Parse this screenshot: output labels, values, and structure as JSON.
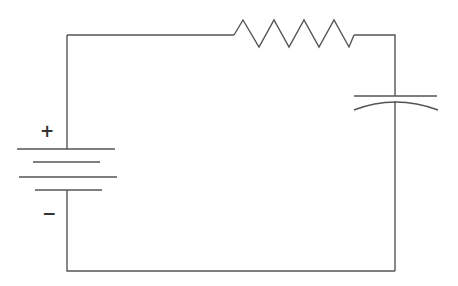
{
  "diagram": {
    "type": "circuit-schematic",
    "components": [
      {
        "id": "battery",
        "kind": "battery",
        "plates": 4,
        "terminals": {
          "positive": "+",
          "negative": "−"
        }
      },
      {
        "id": "resistor",
        "kind": "resistor",
        "zigzag_peaks": 4
      },
      {
        "id": "capacitor",
        "kind": "capacitor",
        "style": "curved-plate (polarized)"
      }
    ],
    "labels": {
      "positive": "+",
      "negative": "−"
    },
    "colors": {
      "line": "#555555",
      "background": "#ffffff"
    }
  }
}
